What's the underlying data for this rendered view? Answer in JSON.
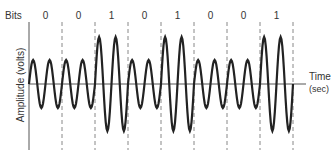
{
  "figure": {
    "bits_label": "Bits",
    "bits": [
      "0",
      "0",
      "1",
      "0",
      "1",
      "0",
      "0",
      "1"
    ],
    "y_axis_label": "Amplitude (volts)",
    "x_axis_label_line1": "Time",
    "x_axis_label_line2": "(sec)",
    "colors": {
      "wave": "#222222",
      "axis": "#555555",
      "divider": "#888888",
      "text": "#333333"
    }
  },
  "chart_data": {
    "type": "line",
    "xlabel": "Time (sec)",
    "ylabel": "Amplitude (volts)",
    "bits": [
      0,
      0,
      1,
      0,
      1,
      0,
      0,
      1
    ],
    "cycles_per_bit": 2,
    "amplitude_low": 1,
    "amplitude_high": 2,
    "grid": false,
    "bit_dividers": "dashed vertical lines"
  }
}
